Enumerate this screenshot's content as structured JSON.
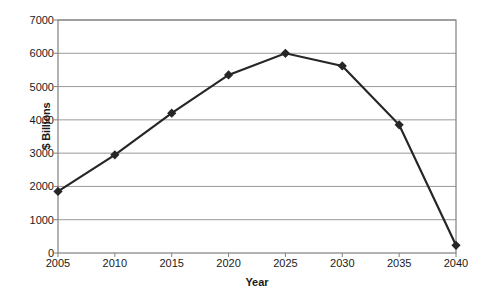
{
  "chart_data": {
    "type": "line",
    "title": "",
    "xlabel": "Year",
    "ylabel": "$ Billions",
    "categories": [
      "2005",
      "2010",
      "2015",
      "2020",
      "2025",
      "2030",
      "2035",
      "2040"
    ],
    "x": [
      2005,
      2010,
      2015,
      2020,
      2025,
      2030,
      2035,
      2040
    ],
    "values": [
      1850,
      2950,
      4200,
      5350,
      6000,
      5620,
      3850,
      230
    ],
    "series": [
      {
        "name": "",
        "values": [
          1850,
          2950,
          4200,
          5350,
          6000,
          5620,
          3850,
          230
        ]
      }
    ],
    "xlim": [
      2005,
      2040
    ],
    "ylim": [
      0,
      7000
    ],
    "y_ticks": [
      0,
      1000,
      2000,
      3000,
      4000,
      5000,
      6000,
      7000
    ],
    "y_tick_labels": [
      "0",
      "1000",
      "2000",
      "3000",
      "4000",
      "5000",
      "6000",
      "7000"
    ],
    "x_ticks": [
      2005,
      2010,
      2015,
      2020,
      2025,
      2030,
      2035,
      2040
    ],
    "x_tick_labels": [
      "2005",
      "2010",
      "2015",
      "2020",
      "2025",
      "2030",
      "2035",
      "2040"
    ],
    "grid": "horizontal",
    "legend": "none",
    "marker": "diamond",
    "line_color": "#262626",
    "marker_color": "#262626",
    "grid_color": "#999999",
    "axis_color": "#808080",
    "background": "#ffffff"
  }
}
